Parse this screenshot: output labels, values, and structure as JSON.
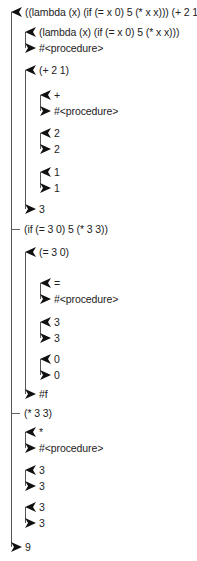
{
  "colors": {
    "line": "#555555",
    "text": "#222222",
    "arrow": "#111111"
  },
  "lines": [
    {
      "x": 11,
      "y1": 12,
      "y2": 547
    },
    {
      "x": 25,
      "y1": 32,
      "y2": 48
    },
    {
      "x": 25,
      "y1": 70,
      "y2": 209
    },
    {
      "x": 40,
      "y1": 95,
      "y2": 111
    },
    {
      "x": 40,
      "y1": 133,
      "y2": 149
    },
    {
      "x": 40,
      "y1": 172,
      "y2": 188
    },
    {
      "x": 25,
      "y1": 252,
      "y2": 394
    },
    {
      "x": 40,
      "y1": 283,
      "y2": 299
    },
    {
      "x": 40,
      "y1": 322,
      "y2": 338
    },
    {
      "x": 40,
      "y1": 359,
      "y2": 375
    },
    {
      "x": 25,
      "y1": 432,
      "y2": 448
    },
    {
      "x": 25,
      "y1": 470,
      "y2": 486
    },
    {
      "x": 25,
      "y1": 507,
      "y2": 523
    }
  ],
  "rows": [
    {
      "kind": "call",
      "x": 11,
      "y": 12,
      "text": "((lambda (x) (if (= x 0) 5 (* x x))) (+ 2 1))"
    },
    {
      "kind": "call",
      "x": 25,
      "y": 32,
      "text": "(lambda (x) (if (= x 0) 5 (* x x)))"
    },
    {
      "kind": "return",
      "x": 25,
      "y": 48,
      "text": "#<procedure>"
    },
    {
      "kind": "call",
      "x": 25,
      "y": 70,
      "text": "(+ 2 1)"
    },
    {
      "kind": "call",
      "x": 40,
      "y": 95,
      "text": "+"
    },
    {
      "kind": "return",
      "x": 40,
      "y": 111,
      "text": "#<procedure>"
    },
    {
      "kind": "call",
      "x": 40,
      "y": 133,
      "text": "2"
    },
    {
      "kind": "return",
      "x": 40,
      "y": 149,
      "text": "2"
    },
    {
      "kind": "call",
      "x": 40,
      "y": 172,
      "text": "1"
    },
    {
      "kind": "return",
      "x": 40,
      "y": 188,
      "text": "1"
    },
    {
      "kind": "return",
      "x": 25,
      "y": 209,
      "text": "3"
    },
    {
      "kind": "tail",
      "x": 11,
      "y": 229,
      "text": "(if (= 3 0) 5 (* 3 3))"
    },
    {
      "kind": "call",
      "x": 25,
      "y": 252,
      "text": "(= 3 0)"
    },
    {
      "kind": "call",
      "x": 40,
      "y": 283,
      "text": "="
    },
    {
      "kind": "return",
      "x": 40,
      "y": 299,
      "text": "#<procedure>"
    },
    {
      "kind": "call",
      "x": 40,
      "y": 322,
      "text": "3"
    },
    {
      "kind": "return",
      "x": 40,
      "y": 338,
      "text": "3"
    },
    {
      "kind": "call",
      "x": 40,
      "y": 359,
      "text": "0"
    },
    {
      "kind": "return",
      "x": 40,
      "y": 375,
      "text": "0"
    },
    {
      "kind": "return",
      "x": 25,
      "y": 394,
      "text": "#f"
    },
    {
      "kind": "tail",
      "x": 11,
      "y": 413,
      "text": "(* 3 3)"
    },
    {
      "kind": "call",
      "x": 25,
      "y": 432,
      "text": "*"
    },
    {
      "kind": "return",
      "x": 25,
      "y": 448,
      "text": "#<procedure>"
    },
    {
      "kind": "call",
      "x": 25,
      "y": 470,
      "text": "3"
    },
    {
      "kind": "return",
      "x": 25,
      "y": 486,
      "text": "3"
    },
    {
      "kind": "call",
      "x": 25,
      "y": 507,
      "text": "3"
    },
    {
      "kind": "return",
      "x": 25,
      "y": 523,
      "text": "3"
    },
    {
      "kind": "return",
      "x": 11,
      "y": 547,
      "text": "9"
    }
  ]
}
